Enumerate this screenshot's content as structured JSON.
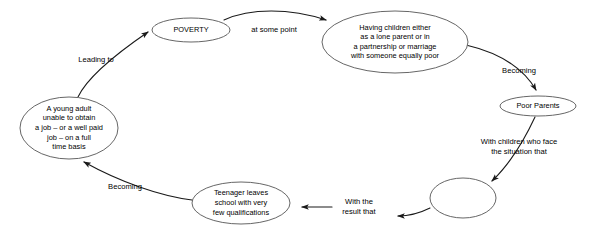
{
  "diagram": {
    "type": "cycle-flow-diagram",
    "canvas": {
      "width": 604,
      "height": 242
    },
    "style": {
      "background_color": "#ffffff",
      "node_stroke_color": "#555555",
      "edge_stroke_color": "#1a1a1a",
      "text_color": "#000000"
    },
    "nodes": [
      {
        "id": "poverty",
        "shape": "ellipse",
        "lines": [
          "POVERTY"
        ],
        "cx": 191,
        "cy": 30,
        "rx": 39,
        "ry": 12,
        "font_size": 8.6
      },
      {
        "id": "having-children",
        "shape": "ellipse",
        "lines": [
          "Having children either",
          "as a lone parent or in",
          "a partnership or marriage",
          "with someone equally poor"
        ],
        "cx": 395,
        "cy": 42,
        "rx": 73,
        "ry": 31,
        "font_size": 7.4
      },
      {
        "id": "poor-parents",
        "shape": "ellipse",
        "lines": [
          "Poor Parents"
        ],
        "cx": 538,
        "cy": 106,
        "rx": 38,
        "ry": 10,
        "font_size": 7.6
      },
      {
        "id": "empty-node",
        "shape": "ellipse",
        "lines": [],
        "cx": 463,
        "cy": 198,
        "rx": 33,
        "ry": 20,
        "font_size": 7.4
      },
      {
        "id": "teenager-leaves-school",
        "shape": "ellipse",
        "lines": [
          "Teenager leaves",
          "school with very",
          "few qualifications"
        ],
        "cx": 241,
        "cy": 203,
        "rx": 49,
        "ry": 21,
        "font_size": 7.4
      },
      {
        "id": "young-adult",
        "shape": "ellipse",
        "lines": [
          "A young adult",
          "unable to obtain",
          "a job – or a well paid",
          "job – on a full",
          "time basis"
        ],
        "cx": 69,
        "cy": 128,
        "rx": 49,
        "ry": 31,
        "font_size": 7.4
      }
    ],
    "edges": [
      {
        "id": "edge-young-adult-to-poverty",
        "from": "young-adult",
        "to": "poverty",
        "label": [
          "Leading to"
        ],
        "label_x": 96,
        "label_y": 60,
        "path": "M 78 97 C 86 80, 110 58, 148 32",
        "arrow_at": {
          "x": 152,
          "y": 30,
          "angle": -32
        }
      },
      {
        "id": "edge-poverty-to-having-children",
        "from": "poverty",
        "to": "having-children",
        "label": [
          "at some point"
        ],
        "label_x": 274,
        "label_y": 30,
        "path": "M 224 20 C 250 8, 290 8, 326 20",
        "arrow_at": {
          "x": 331,
          "y": 22,
          "angle": 24
        }
      },
      {
        "id": "edge-having-children-to-poor-parents",
        "from": "having-children",
        "to": "poor-parents",
        "label": [
          "Becoming"
        ],
        "label_x": 519,
        "label_y": 71,
        "path": "M 466 45 C 496 52, 522 66, 536 90",
        "arrow_at": {
          "x": 538,
          "y": 95,
          "angle": 74
        }
      },
      {
        "id": "edge-poor-parents-to-empty-node",
        "from": "poor-parents",
        "to": "empty-node",
        "label": [
          "With children who face",
          "the situation that"
        ],
        "label_x": 519,
        "label_y": 147,
        "path": "M 535 117 C 528 132, 514 160, 492 181",
        "arrow_at": {
          "x": 488,
          "y": 185,
          "angle": 133
        }
      },
      {
        "id": "edge-empty-node-to-teenager",
        "from": "empty-node",
        "to": "teenager-leaves-school",
        "label": [
          "With the",
          "result that"
        ],
        "label_x": 359,
        "label_y": 207,
        "path": "M 430 208 C 418 214, 408 216, 398 216",
        "arrow_at": {
          "x": 393,
          "y": 216,
          "angle": 182
        }
      },
      {
        "id": "edge-teenager-to-teenager-arrow2",
        "from": "label-with-the-result-that",
        "to": "teenager-leaves-school",
        "label": [],
        "label_x": 0,
        "label_y": 0,
        "path": "M 332 207 L 302 207",
        "arrow_at": {
          "x": 297,
          "y": 207,
          "angle": 180
        }
      },
      {
        "id": "edge-teenager-to-young-adult",
        "from": "teenager-leaves-school",
        "to": "young-adult",
        "label": [
          "Becoming"
        ],
        "label_x": 125,
        "label_y": 187,
        "path": "M 192 200 C 160 196, 120 182, 84 162",
        "arrow_at": {
          "x": 80,
          "y": 159,
          "angle": -150
        }
      }
    ]
  }
}
